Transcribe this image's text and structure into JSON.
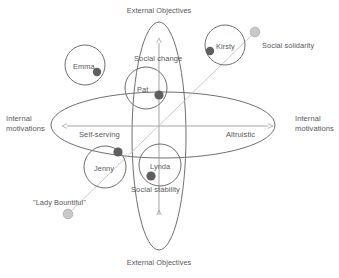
{
  "diagram": {
    "title_top": "External Objectives",
    "title_bottom": "External Objectives",
    "left_side_line1": "Internal",
    "left_side_line2": "motivations",
    "right_side_line1": "Internal",
    "right_side_line2": "motivations",
    "axis_vertical_upper": "Social change",
    "axis_vertical_lower": "Social stability",
    "axis_horizontal_left": "Self-serving",
    "axis_horizontal_right": "Altruistic",
    "annotation_top_right": "Social solidarity",
    "annotation_bottom_left": "\"Lady Bountiful\"",
    "colors": {
      "stroke": "#6f6f6f",
      "text": "#58585a",
      "dot_dark": "#5f5f5f",
      "dot_light": "#b9b9b9",
      "axis": "#9a9a9a",
      "connector": "#c2c2c2",
      "background": "#ffffff"
    },
    "people": [
      {
        "name": "Emma",
        "circle_cx": 85,
        "circle_cy": 65,
        "circle_r": 20,
        "label_x": 73,
        "label_y": 62,
        "dot_cx": 97,
        "dot_cy": 72,
        "dot_r": 4.2
      },
      {
        "name": "Kirsty",
        "circle_cx": 225,
        "circle_cy": 45,
        "circle_r": 20,
        "label_x": 216,
        "label_y": 42,
        "dot_cx": 210,
        "dot_cy": 51,
        "dot_r": 4.2
      },
      {
        "name": "Pat",
        "circle_cx": 146,
        "circle_cy": 88,
        "circle_r": 21,
        "label_x": 136,
        "label_y": 85,
        "dot_cx": 159,
        "dot_cy": 95,
        "dot_r": 4.6
      },
      {
        "name": "Jenny",
        "circle_cx": 105,
        "circle_cy": 167,
        "circle_r": 21,
        "label_x": 94,
        "label_y": 164,
        "dot_cx": 118,
        "dot_cy": 152,
        "dot_r": 4.6
      },
      {
        "name": "Lynda",
        "circle_cx": 160,
        "circle_cy": 165,
        "circle_r": 21,
        "label_x": 150,
        "label_y": 162,
        "dot_cx": 151,
        "dot_cy": 176,
        "dot_r": 4.6
      }
    ],
    "endpoint_markers": [
      {
        "name": "social-solidarity-marker",
        "cx": 255,
        "cy": 32,
        "r": 4.8
      },
      {
        "name": "lady-bountiful-marker",
        "cx": 68,
        "cy": 214,
        "r": 4.8
      }
    ],
    "connector_line": {
      "x1": 255,
      "y1": 32,
      "x2": 68,
      "y2": 214
    },
    "ellipse_horizontal": {
      "cx": 163,
      "cy": 125,
      "rx": 112,
      "ry": 33
    },
    "ellipse_vertical": {
      "cx": 159,
      "cy": 136,
      "rx": 27,
      "ry": 114
    },
    "axis_horizontal": {
      "x1": 67,
      "x2": 268,
      "y": 126
    },
    "axis_vertical": {
      "y1": 43,
      "y2": 215,
      "x": 159
    }
  }
}
